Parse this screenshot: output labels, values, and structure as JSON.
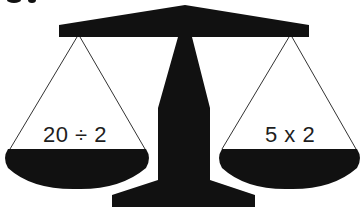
{
  "diagram": {
    "type": "balance-scale",
    "colors": {
      "fill": "#111111",
      "string": "#333333",
      "background": "#ffffff",
      "text": "#1e1e1e"
    },
    "left_pan": {
      "expression": "20 ÷ 2"
    },
    "right_pan": {
      "expression": "5 x 2"
    }
  }
}
